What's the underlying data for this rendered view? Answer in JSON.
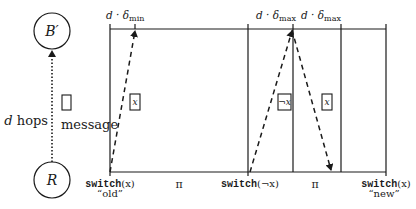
{
  "nodes": {
    "top": {
      "label": "B′"
    },
    "bottom": {
      "label": "R"
    }
  },
  "left_panel": {
    "hops_label_var": "d",
    "hops_label_text": " hops",
    "message_label": "message"
  },
  "timeline": {
    "top_labels": [
      {
        "var": "d · δ",
        "sub": "min"
      },
      {
        "var": "d · δ",
        "sub": "max"
      },
      {
        "var": "d · δ",
        "sub": "max"
      }
    ],
    "bottom_labels": [
      {
        "cmd": "switch",
        "arg": "(x)",
        "quote": "“old”"
      },
      {
        "pi": "π"
      },
      {
        "cmd": "switch",
        "arg": "(¬x)"
      },
      {
        "pi": "π"
      },
      {
        "cmd": "switch",
        "arg": "(x)",
        "quote": "“new”"
      }
    ],
    "message_boxes": [
      {
        "label": "x"
      },
      {
        "label": "¬x"
      },
      {
        "label": "x"
      }
    ]
  },
  "colors": {
    "stroke": "#1a1a1a",
    "background": "#ffffff"
  }
}
